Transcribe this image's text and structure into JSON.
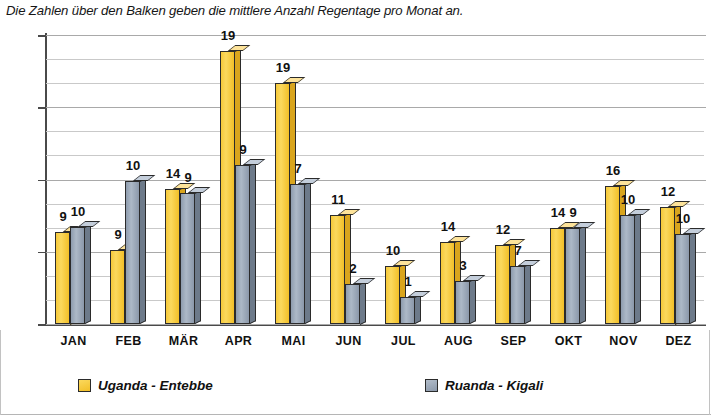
{
  "caption": {
    "cut_line": "Regentage pro Monat",
    "text": "Die Zahlen über den Balken geben die mittlere Anzahl Regentage pro Monat an."
  },
  "legend": {
    "uganda": {
      "label": "Uganda - Entebbe",
      "color": "#F5C630"
    },
    "ruanda": {
      "label": "Ruanda - Kigali",
      "color": "#8C9AAD"
    }
  },
  "axis": {
    "y_ticks": [
      "0",
      "75",
      "150",
      "225",
      "300"
    ]
  },
  "chart_data": {
    "type": "bar",
    "title": "",
    "subtitle": "Die Zahlen über den Balken geben die mittlere Anzahl Regentage pro Monat an.",
    "xlabel": "",
    "ylabel": "",
    "ylim": [
      0,
      300
    ],
    "yticks": [
      0,
      75,
      150,
      225,
      300
    ],
    "grid": true,
    "legend_position": "bottom",
    "categories": [
      "JAN",
      "FEB",
      "MÄR",
      "APR",
      "MAI",
      "JUN",
      "JUL",
      "AUG",
      "SEP",
      "OKT",
      "NOV",
      "DEZ"
    ],
    "series": [
      {
        "name": "Uganda - Entebbe",
        "color": "#F5C630",
        "values": [
          96,
          77,
          140,
          283,
          250,
          113,
          60,
          85,
          82,
          100,
          143,
          122
        ],
        "labels": [
          9,
          9,
          14,
          19,
          19,
          11,
          10,
          14,
          12,
          14,
          16,
          12
        ]
      },
      {
        "name": "Ruanda - Kigali",
        "color": "#8C9AAD",
        "values": [
          101,
          148,
          136,
          165,
          145,
          42,
          28,
          45,
          60,
          100,
          113,
          93
        ],
        "labels": [
          10,
          10,
          9,
          9,
          7,
          2,
          1,
          3,
          7,
          9,
          10,
          10
        ]
      }
    ]
  }
}
